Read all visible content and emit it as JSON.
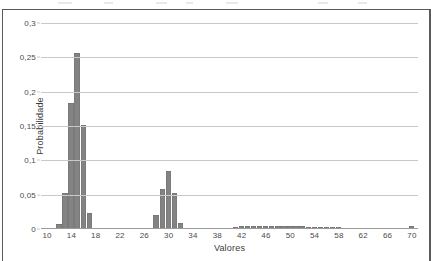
{
  "chart_data": {
    "type": "bar",
    "title": "",
    "subtitle": "",
    "xlabel": "Valores",
    "ylabel": "Probabilidade",
    "decimal_separator": ",",
    "xlim": [
      9,
      71
    ],
    "ylim": [
      0,
      0.3
    ],
    "grid": true,
    "legend": null,
    "legend_position": "none",
    "bar_color": "#838383",
    "gridline_color": "#c9c9c9",
    "axis_text_color": "#4a4a4a",
    "frame_color": "#5a5a5a",
    "y_ticks": [
      {
        "value": 0,
        "label": "0"
      },
      {
        "value": 0.05,
        "label": "0,05"
      },
      {
        "value": 0.1,
        "label": "0,1"
      },
      {
        "value": 0.15,
        "label": "0,15"
      },
      {
        "value": 0.2,
        "label": "0,2"
      },
      {
        "value": 0.25,
        "label": "0,25"
      },
      {
        "value": 0.3,
        "label": "0,3"
      }
    ],
    "x_ticks": [
      {
        "value": 10,
        "label": "10"
      },
      {
        "value": 14,
        "label": "14"
      },
      {
        "value": 18,
        "label": "18"
      },
      {
        "value": 22,
        "label": "22"
      },
      {
        "value": 26,
        "label": "26"
      },
      {
        "value": 30,
        "label": "30"
      },
      {
        "value": 34,
        "label": "34"
      },
      {
        "value": 38,
        "label": "38"
      },
      {
        "value": 42,
        "label": "42"
      },
      {
        "value": 46,
        "label": "46"
      },
      {
        "value": 50,
        "label": "50"
      },
      {
        "value": 54,
        "label": "54"
      },
      {
        "value": 58,
        "label": "58"
      },
      {
        "value": 62,
        "label": "62"
      },
      {
        "value": 66,
        "label": "66"
      },
      {
        "value": 70,
        "label": "70"
      }
    ],
    "x": [
      10,
      11,
      12,
      13,
      14,
      15,
      16,
      17,
      18,
      19,
      20,
      21,
      22,
      23,
      24,
      25,
      26,
      27,
      28,
      29,
      30,
      31,
      32,
      33,
      34,
      35,
      36,
      37,
      38,
      39,
      40,
      41,
      42,
      43,
      44,
      45,
      46,
      47,
      48,
      49,
      50,
      51,
      52,
      53,
      54,
      55,
      56,
      57,
      58,
      59,
      60,
      61,
      62,
      63,
      64,
      65,
      66,
      67,
      68,
      69,
      70
    ],
    "values": [
      0,
      0,
      0.007,
      0.052,
      0.183,
      0.257,
      0.151,
      0.023,
      0.002,
      0,
      0,
      0,
      0,
      0,
      0,
      0,
      0,
      0.002,
      0.021,
      0.059,
      0.084,
      0.053,
      0.009,
      0.001,
      0,
      0,
      0,
      0.001,
      0.001,
      0.002,
      0.002,
      0.003,
      0.004,
      0.004,
      0.004,
      0.005,
      0.005,
      0.004,
      0.004,
      0.005,
      0.004,
      0.004,
      0.004,
      0.003,
      0.003,
      0.003,
      0.003,
      0.003,
      0.003,
      0.002,
      0.002,
      0.002,
      0.002,
      0.002,
      0.001,
      0.001,
      0.001,
      0.001,
      0.001,
      0.001,
      0.004
    ]
  }
}
